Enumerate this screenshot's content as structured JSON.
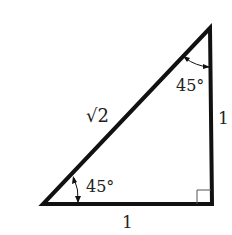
{
  "diagram": {
    "colors": {
      "stroke": "#111111",
      "text": "#222222",
      "background": "#ffffff"
    },
    "vertices": {
      "top": [
        210,
        28
      ],
      "bottom_left": [
        43,
        204
      ],
      "bottom_right": [
        212,
        204
      ]
    },
    "labels": {
      "hypotenuse": "√2",
      "vertical_side": "1",
      "horizontal_side": "1",
      "top_angle": "45°",
      "bottom_angle": "45°"
    },
    "right_angle_marker": "square at bottom-right vertex"
  }
}
